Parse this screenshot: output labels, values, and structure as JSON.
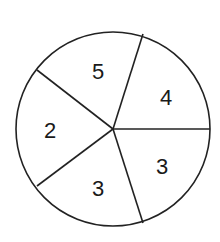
{
  "spinner": {
    "center": [
      113,
      129
    ],
    "radius": 97,
    "stroke_color": "#222222",
    "dividers": [
      {
        "x": 143,
        "y": 34
      },
      {
        "x": 210,
        "y": 129
      },
      {
        "x": 143,
        "y": 223
      },
      {
        "x": 37,
        "y": 186
      },
      {
        "x": 37,
        "y": 70
      }
    ],
    "sections": [
      {
        "label": "5",
        "x": 98,
        "y": 71
      },
      {
        "label": "4",
        "x": 166,
        "y": 97
      },
      {
        "label": "3",
        "x": 162,
        "y": 166
      },
      {
        "label": "3",
        "x": 98,
        "y": 188
      },
      {
        "label": "2",
        "x": 50,
        "y": 130
      }
    ]
  }
}
